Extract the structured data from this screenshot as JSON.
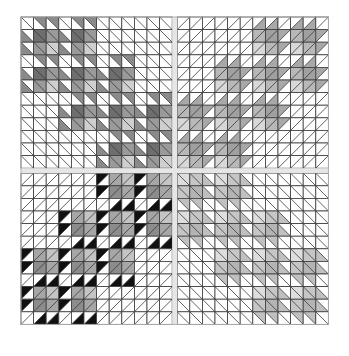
{
  "quilt": {
    "origin": [
      21,
      17
    ],
    "cell_size": 12.6,
    "cells_per_quadrant": 12,
    "sashing_width": 5,
    "colors": {
      "background": "#ffffff",
      "sashing": "#e6e6e6",
      "grid_line": "#3a3a3a",
      "white": "#ffffff"
    },
    "quadrants": [
      {
        "name": "top-left",
        "diagonal": "\\",
        "flip_x": false,
        "flip_y": false,
        "palette": {
          "hst": "#8a8a8a",
          "dark": "#6e6e6e",
          "mid": "#9a9a9a",
          "light": "#cfcfcf"
        },
        "occupancy": [
          [
            1,
            1,
            0,
            0
          ],
          [
            1,
            1,
            1,
            0
          ],
          [
            0,
            1,
            1,
            1
          ],
          [
            0,
            0,
            1,
            1
          ]
        ]
      },
      {
        "name": "top-right",
        "diagonal": "/",
        "flip_x": true,
        "flip_y": false,
        "palette": {
          "hst": "#a8a8a8",
          "dark": "#a0a0a0",
          "mid": "#b8b8b8",
          "light": "#d8d8d8"
        },
        "occupancy": [
          [
            0,
            0,
            1,
            1
          ],
          [
            0,
            1,
            1,
            1
          ],
          [
            1,
            1,
            1,
            0
          ],
          [
            1,
            1,
            0,
            0
          ]
        ]
      },
      {
        "name": "bottom-left",
        "diagonal": "/",
        "flip_x": false,
        "flip_y": true,
        "palette": {
          "hst": "#111111",
          "dark": "#8c8c8c",
          "mid": "#a6a6a6",
          "light": "#c4c4c4"
        },
        "occupancy": [
          [
            0,
            0,
            1,
            1
          ],
          [
            0,
            1,
            1,
            1
          ],
          [
            1,
            1,
            1,
            0
          ],
          [
            1,
            1,
            0,
            0
          ]
        ]
      },
      {
        "name": "bottom-right",
        "diagonal": "\\",
        "flip_x": true,
        "flip_y": true,
        "palette": {
          "hst": "#c0c0c0",
          "dark": "#b4b4b4",
          "mid": "#c6c6c6",
          "light": "#dedede"
        },
        "occupancy": [
          [
            1,
            1,
            0,
            0
          ],
          [
            1,
            1,
            1,
            0
          ],
          [
            0,
            1,
            1,
            1
          ],
          [
            0,
            0,
            1,
            1
          ]
        ]
      }
    ],
    "motif": {
      "description": "3x3 paw block: corner white, two edge rows/cols of half-square triangles, 2x2 center of solid squares",
      "cells": [
        [
          "white",
          "hst",
          "hst"
        ],
        [
          "hst",
          "dark",
          "mid"
        ],
        [
          "hst",
          "mid",
          "light"
        ]
      ]
    }
  }
}
